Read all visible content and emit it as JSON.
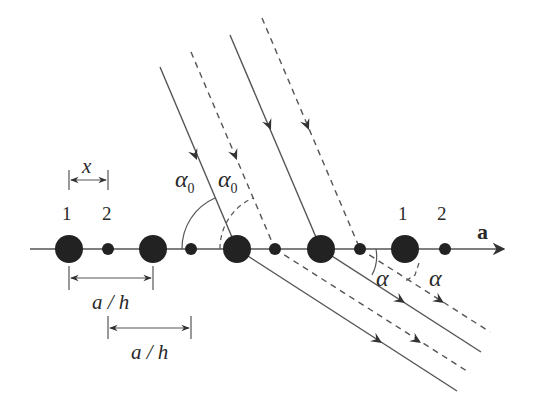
{
  "diagram": {
    "axis": {
      "label": "a",
      "y": 249,
      "x_start": 30,
      "x_end": 506
    },
    "atoms": {
      "type1": {
        "label": "1",
        "radius": 14,
        "x": [
          69,
          153,
          237,
          321,
          405
        ]
      },
      "type2": {
        "label": "2",
        "radius": 6,
        "x": [
          108,
          191,
          275,
          360,
          445
        ]
      }
    },
    "basis_labels": [
      {
        "text": "1",
        "x": 62,
        "y": 203
      },
      {
        "text": "2",
        "x": 102,
        "y": 203
      },
      {
        "text": "1",
        "x": 398,
        "y": 203
      },
      {
        "text": "2",
        "x": 437,
        "y": 203
      }
    ],
    "dimensions": [
      {
        "label": "x",
        "x1": 69,
        "x2": 108,
        "y": 180
      },
      {
        "label": "a / h",
        "x1": 69,
        "x2": 153,
        "y": 278
      },
      {
        "label": "a / h",
        "x1": 108,
        "x2": 191,
        "y": 327
      }
    ],
    "angles": {
      "incident": {
        "symbol": "α",
        "subscript": "0"
      },
      "scattered": {
        "symbol": "α"
      }
    },
    "incident_rays": [
      {
        "style": "solid",
        "from": [
          160,
          67
        ],
        "to": [
          237,
          249
        ]
      },
      {
        "style": "dashed",
        "from": [
          191,
          52
        ],
        "to": [
          275,
          249
        ]
      },
      {
        "style": "solid",
        "from": [
          230,
          35
        ],
        "to": [
          321,
          249
        ]
      },
      {
        "style": "dashed",
        "from": [
          262,
          18
        ],
        "to": [
          360,
          249
        ]
      }
    ],
    "scattered_rays": [
      {
        "style": "solid",
        "from": [
          237,
          249
        ],
        "to": [
          457,
          391
        ]
      },
      {
        "style": "dashed",
        "from": [
          275,
          249
        ],
        "to": [
          470,
          373
        ]
      },
      {
        "style": "solid",
        "from": [
          321,
          249
        ],
        "to": [
          481,
          352
        ]
      },
      {
        "style": "dashed",
        "from": [
          360,
          249
        ],
        "to": [
          490,
          332
        ]
      }
    ],
    "colors": {
      "line": "#555555",
      "atom": "#222222",
      "text": "#2a2a2a"
    }
  }
}
